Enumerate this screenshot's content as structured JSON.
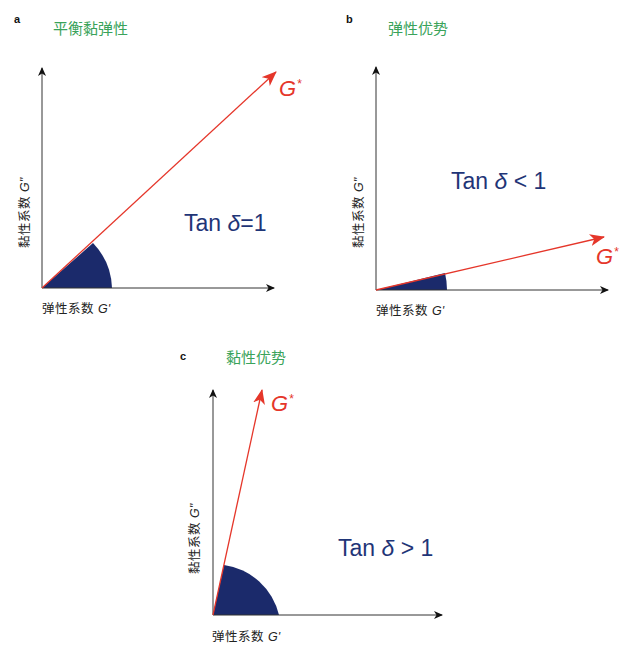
{
  "panels": {
    "a": {
      "letter": "a",
      "title": "平衡黏弹性",
      "tan_text": "Tan",
      "delta": "δ",
      "relation": "=1",
      "vector_label": "G",
      "vector_sup": "*",
      "x_axis_label": "弹性系数",
      "x_axis_symbol": "G'",
      "y_axis_label": "黏性系数",
      "y_axis_symbol": "G''"
    },
    "b": {
      "letter": "b",
      "title": "弹性优势",
      "tan_text": "Tan",
      "delta": "δ",
      "relation": " < 1",
      "vector_label": "G",
      "vector_sup": "*",
      "x_axis_label": "弹性系数",
      "x_axis_symbol": "G'",
      "y_axis_label": "黏性系数",
      "y_axis_symbol": "G''"
    },
    "c": {
      "letter": "c",
      "title": "黏性优势",
      "tan_text": "Tan",
      "delta": "δ",
      "relation": " > 1",
      "vector_label": "G",
      "vector_sup": "*",
      "x_axis_label": "弹性系数",
      "x_axis_symbol": "G'",
      "y_axis_label": "黏性系数",
      "y_axis_symbol": "G''"
    }
  },
  "colors": {
    "vector": "#e5362a",
    "wedge": "#1b2a6b",
    "tan_text": "#1f3577",
    "title": "#3aa35a",
    "axis": "#111111"
  }
}
